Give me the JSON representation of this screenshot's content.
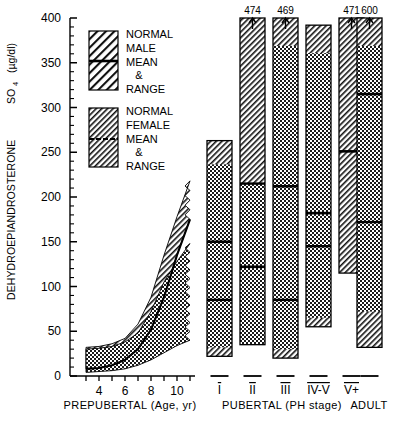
{
  "axes": {
    "ylabel_main": "DEHYDROEPIANDROSTERONE",
    "ylabel_sub": "SO",
    "ylabel_sub_index": "4",
    "ylabel_units": "(µg/dl)",
    "y_ticks": [
      "400",
      "350",
      "300",
      "250",
      "200",
      "150",
      "100",
      "50",
      "0"
    ],
    "y_values": [
      400,
      350,
      300,
      250,
      200,
      150,
      100,
      50,
      0
    ],
    "y_range": [
      0,
      400
    ],
    "x_ticks_left": [
      "4",
      "6",
      "8",
      "10"
    ],
    "x_values_left": [
      4,
      6,
      8,
      10
    ],
    "xlabel_left": "PREPUBERTAL  (Age, yr)",
    "xlabel_mid": "PUBERTAL  (PH stage)",
    "xlabel_right": "ADULT"
  },
  "legend": {
    "items": [
      {
        "name": "normal-male",
        "pattern": "diagonal-hatch",
        "lines": [
          "NORMAL",
          "MALE",
          "MEAN",
          "&",
          "RANGE"
        ]
      },
      {
        "name": "normal-female",
        "pattern": "dense-diagonal-hatch",
        "lines": [
          "NORMAL",
          "FEMALE",
          "MEAN",
          "&",
          "RANGE"
        ]
      }
    ]
  },
  "chart_data": {
    "type": "bar",
    "title": "",
    "xlabel": "PREPUBERTAL (Age, yr) / PUBERTAL (PH stage) / ADULT",
    "ylabel": "DEHYDROEPIANDROSTERONE SO4 (µg/dl)",
    "ylim": [
      0,
      400
    ],
    "grid": false,
    "legend_position": "upper-left-inset",
    "categories": [
      "I",
      "II",
      "III",
      "IV-V",
      "V+",
      "ADULT"
    ],
    "bars": [
      {
        "stage": "I",
        "top": 263,
        "bottom": 22,
        "mean": 150,
        "second_line": 85,
        "overflow_label": null,
        "fill": "dots",
        "cap": "hatch"
      },
      {
        "stage": "II",
        "top": 400,
        "bottom": 35,
        "mean": 122,
        "second_line": 215,
        "overflow_label": "474",
        "fill": "hatch-over-dots",
        "cap": "hatch"
      },
      {
        "stage": "III",
        "top": 400,
        "bottom": 20,
        "mean": 212,
        "second_line": 85,
        "overflow_label": "469",
        "fill": "dots",
        "cap": "hatch"
      },
      {
        "stage": "IV-V",
        "top": 392,
        "bottom": 55,
        "mean": 182,
        "second_line": 145,
        "overflow_label": null,
        "fill": "dots",
        "cap": "hatch"
      },
      {
        "stage": "V+",
        "top": 400,
        "bottom": 115,
        "mean": 251,
        "overflow_label": "471",
        "fill": "hatch",
        "cap": "hatch"
      },
      {
        "stage": "ADULT",
        "top": 400,
        "bottom": 32,
        "mean": 315,
        "second_line": 172,
        "overflow_label": "600",
        "fill": "dots",
        "cap": "hatch"
      }
    ],
    "prepubertal_curve": {
      "x": [
        3,
        4,
        5,
        6,
        7,
        8,
        9,
        10,
        11
      ],
      "mean": [
        8,
        9,
        12,
        18,
        30,
        52,
        88,
        135,
        175
      ],
      "male_upper": [
        32,
        33,
        36,
        42,
        58,
        88,
        135,
        178,
        218
      ],
      "female_upper": [
        30,
        31,
        33,
        38,
        48,
        72,
        105,
        128,
        148
      ],
      "lower": [
        4,
        5,
        6,
        8,
        12,
        18,
        26,
        34,
        40
      ],
      "upper_band_pattern": "diagonal-hatch",
      "lower_band_pattern": "dots"
    }
  }
}
